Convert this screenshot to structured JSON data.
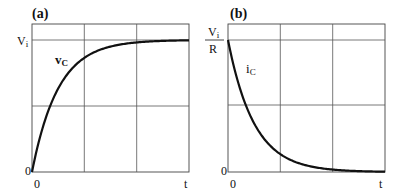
{
  "chart_data": [
    {
      "type": "line",
      "panel_label": "(a)",
      "title": "",
      "xlabel": "t",
      "ylabel": "",
      "x_ticks": [
        "0",
        "t"
      ],
      "y_ticks": [
        {
          "label": "0",
          "value": 0
        },
        {
          "label": "V",
          "sub": "i",
          "value": 1
        }
      ],
      "grid": true,
      "x_range_tau": [
        0,
        6
      ],
      "grid_x_tau": [
        2,
        4
      ],
      "grid_y_fraction": [
        0.5,
        1.0
      ],
      "y_top_fraction": 1.12,
      "series": [
        {
          "name": "vC",
          "label_main": "v",
          "label_sub": "C",
          "formula": "Vi*(1-exp(-t/tau))",
          "x_tau": [
            0,
            0.5,
            1,
            1.5,
            2,
            3,
            4,
            5,
            6
          ],
          "values_fraction_of_Vi": [
            0,
            0.39,
            0.63,
            0.78,
            0.86,
            0.95,
            0.98,
            0.99,
            1.0
          ]
        }
      ]
    },
    {
      "type": "line",
      "panel_label": "(b)",
      "title": "",
      "xlabel": "t",
      "ylabel": "",
      "x_ticks": [
        "0",
        "t"
      ],
      "y_ticks": [
        {
          "label": "0",
          "value": 0
        },
        {
          "label_num": "V",
          "label_num_sub": "i",
          "label_den": "R",
          "value": 1
        }
      ],
      "grid": true,
      "x_range_tau": [
        0,
        6
      ],
      "grid_x_tau": [
        2,
        4
      ],
      "grid_y_fraction": [
        0.5,
        1.0
      ],
      "y_top_fraction": 1.12,
      "series": [
        {
          "name": "iC",
          "label_main": "i",
          "label_sub": "C",
          "formula": "(Vi/R)*exp(-t/tau)",
          "x_tau": [
            0,
            0.5,
            1,
            1.5,
            2,
            3,
            4,
            5,
            6
          ],
          "values_fraction_of_Vi_over_R": [
            1.0,
            0.61,
            0.37,
            0.22,
            0.14,
            0.05,
            0.02,
            0.01,
            0.0
          ]
        }
      ]
    }
  ],
  "panels": {
    "a": {
      "label": "(a)",
      "y_top_label": "V",
      "y_top_sub": "i",
      "y_zero": "0",
      "x_zero": "0",
      "x_end": "t",
      "curve_label": "v",
      "curve_sub": "C"
    },
    "b": {
      "label": "(b)",
      "y_top_num": "V",
      "y_top_num_sub": "i",
      "y_top_den": "R",
      "y_zero": "0",
      "x_zero": "0",
      "x_end": "t",
      "curve_label": "i",
      "curve_sub": "C"
    }
  },
  "colors": {
    "frame": "#333333",
    "grid": "#555555",
    "curve": "#111111",
    "background": "#ffffff"
  }
}
